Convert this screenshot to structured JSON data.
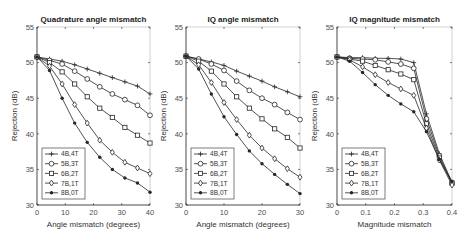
{
  "figure": {
    "legend_labels": [
      "4B,4T",
      "5B,3T",
      "6B,2T",
      "7B,1T",
      "8B,0T"
    ],
    "markers": [
      "plus",
      "circle",
      "square",
      "diamond",
      "asterisk"
    ],
    "line_color": "#262626",
    "axis_color": "#262626",
    "tick_label_color": "#4d4d4d"
  },
  "chart_data": [
    {
      "type": "line",
      "title": "Quadrature angle mismatch",
      "xlabel": "Angle mismatch (degrees)",
      "ylabel": "Rejection (dB)",
      "xlim": [
        0,
        40
      ],
      "ylim": [
        30,
        55
      ],
      "xticks": [
        0,
        10,
        20,
        30,
        40
      ],
      "yticks": [
        30,
        35,
        40,
        45,
        50,
        55
      ],
      "legend_position": "lower left",
      "grid": false,
      "x": [
        0,
        4.44,
        8.89,
        13.33,
        17.78,
        22.22,
        26.67,
        31.11,
        35.56,
        40
      ],
      "series": [
        {
          "name": "4B,4T",
          "marker": "plus",
          "values": [
            50.8,
            50.5,
            50.2,
            49.7,
            49.1,
            48.5,
            47.9,
            47.3,
            46.7,
            45.6
          ]
        },
        {
          "name": "5B,3T",
          "marker": "circle",
          "values": [
            50.8,
            50.3,
            49.8,
            48.8,
            47.7,
            46.6,
            45.6,
            44.8,
            44.0,
            42.6
          ]
        },
        {
          "name": "6B,2T",
          "marker": "square",
          "values": [
            50.8,
            50.0,
            48.7,
            47.0,
            45.2,
            43.6,
            42.3,
            40.9,
            39.8,
            38.7
          ]
        },
        {
          "name": "7B,1T",
          "marker": "diamond",
          "values": [
            50.8,
            49.5,
            47.0,
            44.1,
            41.5,
            39.1,
            37.4,
            36.0,
            35.2,
            34.4
          ]
        },
        {
          "name": "8B,0T",
          "marker": "asterisk",
          "values": [
            50.8,
            48.9,
            45.0,
            41.5,
            38.8,
            36.7,
            35.0,
            33.8,
            33.1,
            31.8
          ]
        }
      ]
    },
    {
      "type": "line",
      "title": "IQ angle mismatch",
      "xlabel": "Angle mismatch (degrees)",
      "ylabel": "Rejection (dB)",
      "xlim": [
        0,
        30
      ],
      "ylim": [
        30,
        55
      ],
      "xticks": [
        0,
        10,
        20,
        30
      ],
      "yticks": [
        30,
        35,
        40,
        45,
        50,
        55
      ],
      "legend_position": "lower left",
      "grid": false,
      "x": [
        0,
        3.33,
        6.67,
        10,
        13.33,
        16.67,
        20,
        23.33,
        26.67,
        30
      ],
      "series": [
        {
          "name": "4B,4T",
          "marker": "plus",
          "values": [
            50.9,
            50.5,
            50.1,
            49.6,
            48.8,
            48.1,
            47.4,
            46.6,
            45.9,
            45.2
          ]
        },
        {
          "name": "5B,3T",
          "marker": "circle",
          "values": [
            50.9,
            50.5,
            49.8,
            48.9,
            47.4,
            46.1,
            45.0,
            44.1,
            43.0,
            42.0
          ]
        },
        {
          "name": "6B,2T",
          "marker": "square",
          "values": [
            50.9,
            50.2,
            48.8,
            47.0,
            45.2,
            43.6,
            42.1,
            40.7,
            39.5,
            38.0
          ]
        },
        {
          "name": "7B,1T",
          "marker": "diamond",
          "values": [
            50.9,
            49.7,
            47.2,
            44.4,
            42.0,
            39.8,
            38.0,
            36.5,
            35.1,
            33.9
          ]
        },
        {
          "name": "8B,0T",
          "marker": "asterisk",
          "values": [
            50.9,
            49.1,
            45.6,
            42.4,
            39.9,
            37.6,
            35.8,
            34.3,
            32.9,
            31.6
          ]
        }
      ]
    },
    {
      "type": "line",
      "title": "IQ magnitude mismatch",
      "xlabel": "Magnitude mismatch",
      "ylabel": "Rejection (dB)",
      "xlim": [
        0,
        0.4
      ],
      "ylim": [
        30,
        55
      ],
      "xticks": [
        0,
        0.1,
        0.2,
        0.3,
        0.4
      ],
      "yticks": [
        30,
        35,
        40,
        45,
        50,
        55
      ],
      "legend_position": "lower left",
      "grid": false,
      "x": [
        0,
        0.044,
        0.089,
        0.133,
        0.178,
        0.222,
        0.267,
        0.311,
        0.356,
        0.4
      ],
      "series": [
        {
          "name": "4B,4T",
          "marker": "plus",
          "values": [
            50.8,
            50.7,
            50.7,
            50.6,
            50.6,
            50.5,
            50.0,
            42.8,
            37.2,
            33.2
          ]
        },
        {
          "name": "5B,3T",
          "marker": "circle",
          "values": [
            50.8,
            50.6,
            50.5,
            50.4,
            50.1,
            49.8,
            49.2,
            42.1,
            36.9,
            33.0
          ]
        },
        {
          "name": "6B,2T",
          "marker": "square",
          "values": [
            50.8,
            50.5,
            50.2,
            49.6,
            49.0,
            48.4,
            47.6,
            41.4,
            36.6,
            33.1
          ]
        },
        {
          "name": "7B,1T",
          "marker": "diamond",
          "values": [
            50.8,
            50.4,
            49.4,
            48.3,
            47.2,
            46.3,
            45.4,
            40.8,
            36.3,
            32.8
          ]
        },
        {
          "name": "8B,0T",
          "marker": "asterisk",
          "values": [
            50.8,
            50.2,
            48.6,
            46.9,
            45.4,
            44.2,
            43.1,
            40.3,
            36.4,
            33.3
          ]
        }
      ]
    }
  ]
}
